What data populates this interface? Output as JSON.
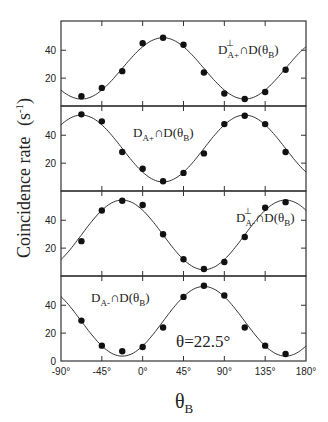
{
  "chart_data": {
    "type": "scatter",
    "layout": "4 vertically stacked panels sharing x-axis",
    "xlabel": "θ_B",
    "ylabel": "Coincidence rate (s^-1)",
    "x_ticks": [
      "-90°",
      "-45°",
      "0°",
      "45°",
      "90°",
      "135°",
      "180°"
    ],
    "x_tick_values": [
      -90,
      -45,
      0,
      45,
      90,
      135,
      180
    ],
    "xlim": [
      -90,
      180
    ],
    "y_ticks": [
      0,
      20,
      40
    ],
    "ylim": [
      0,
      61
    ],
    "annotation": "θ=22.5°",
    "x": [
      -67.5,
      -45,
      -22.5,
      0,
      22.5,
      45,
      67.5,
      90,
      112.5,
      135,
      157.5
    ],
    "series": [
      {
        "name": "D⊥A+ ∩ D(θB)",
        "label_main": "D",
        "label_sup": "⊥",
        "label_sub": "A+",
        "label_rest": "∩D(θ",
        "label_rest_sub": "B",
        "label_close": ")",
        "values": [
          7,
          13,
          25,
          45,
          49,
          44,
          24,
          9,
          5,
          10,
          26
        ],
        "fit": {
          "offset": 27,
          "amplitude": 22,
          "peak_deg": 22.5
        }
      },
      {
        "name": "DA+ ∩ D(θB)",
        "label_main": "D",
        "label_sup": "",
        "label_sub": "A+",
        "label_rest": "∩D(θ",
        "label_rest_sub": "B",
        "label_close": ")",
        "values": [
          55,
          50,
          28,
          16,
          7,
          13,
          27,
          48,
          54,
          48,
          28
        ],
        "fit": {
          "offset": 30.5,
          "amplitude": 24,
          "peak_deg": -67.5
        }
      },
      {
        "name": "D⊥A- ∩ D(θB)",
        "label_main": "D",
        "label_sup": "⊥",
        "label_sub": "A-",
        "label_rest": "∩D(θ",
        "label_rest_sub": "B",
        "label_close": ")",
        "values": [
          25,
          47,
          54,
          51,
          30,
          12,
          5,
          10,
          28,
          49,
          53
        ],
        "fit": {
          "offset": 29.5,
          "amplitude": 25,
          "peak_deg": -22.5
        }
      },
      {
        "name": "DA- ∩ D(θB)",
        "label_main": "D",
        "label_sup": "",
        "label_sub": "A-",
        "label_rest": "∩D(θ",
        "label_rest_sub": "B",
        "label_close": ")",
        "values": [
          29,
          11,
          7,
          10,
          24,
          46,
          54,
          47,
          24,
          11,
          5
        ],
        "fit": {
          "offset": 28.5,
          "amplitude": 25,
          "peak_deg": 67.5
        }
      }
    ],
    "grid": false,
    "legend": "in-panel text labels"
  },
  "labels": {
    "y_axis": "Coincidence rate",
    "y_axis_unit": "(s",
    "y_axis_unit_sup": "-1",
    "y_axis_unit_close": ")",
    "x_axis_main": "θ",
    "x_axis_sub": "B",
    "annotation": "θ=22.5°"
  },
  "colors": {
    "line": "#333333",
    "points": "#111111",
    "frame": "#333333"
  }
}
